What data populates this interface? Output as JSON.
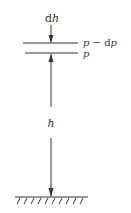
{
  "diagram": {
    "labels": {
      "dh_d": "d",
      "dh_h": "h",
      "upper_layer_p": "p",
      "upper_layer_minus": " − d",
      "upper_layer_p2": "p",
      "lower_layer": "p",
      "height": "h"
    },
    "colors": {
      "line": "#333333",
      "background": "#ffffff"
    }
  }
}
